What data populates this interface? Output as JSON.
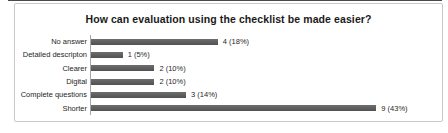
{
  "top_title": "How can evaluation using the checklist be made easier?",
  "colors": {
    "bar": "#5a5a5a",
    "frame_border": "#c9c9c9",
    "axis_line": "#a6a6a6",
    "text": "#262626",
    "top_edge_line": "#4a4a4a"
  },
  "chart_data": {
    "type": "bar",
    "orientation": "horizontal",
    "title": "How can evaluation using the checklist be made easier?",
    "categories": [
      "No answer",
      "Detailed descripton",
      "Clearer",
      "Digital",
      "Complete questions",
      "Shorter"
    ],
    "values": [
      4,
      1,
      2,
      2,
      3,
      9
    ],
    "percentages": [
      18,
      5,
      10,
      10,
      14,
      43
    ],
    "value_labels": [
      "4 (18%)",
      "1 (5%)",
      "2 (10%)",
      "2 (10%)",
      "3 (14%)",
      "9 (43%)"
    ],
    "xlabel": "",
    "ylabel": "",
    "xlim": [
      0,
      9
    ],
    "grid": false,
    "legend": false,
    "data_labels": true,
    "bar_color": "#5a5a5a"
  }
}
